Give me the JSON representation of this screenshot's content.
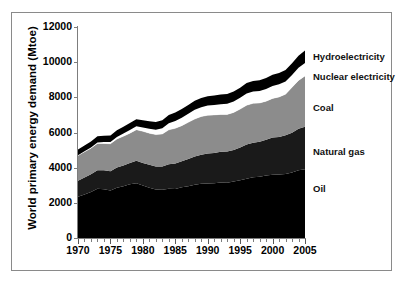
{
  "chart_data": {
    "type": "area",
    "stacked": true,
    "title": "",
    "xlabel": "",
    "ylabel": "World primary energy demand (Mtoe)",
    "xlim": [
      1970,
      2005
    ],
    "ylim": [
      0,
      12000
    ],
    "grid": false,
    "legend_position": "right-inline",
    "y_ticks": [
      0,
      2000,
      4000,
      6000,
      8000,
      10000,
      12000
    ],
    "y_tick_labels": [
      "0",
      "2000",
      "4000",
      "6000",
      "8000",
      "10000",
      "12000"
    ],
    "x_ticks": [
      1970,
      1975,
      1980,
      1985,
      1990,
      1995,
      2000,
      2005
    ],
    "x_tick_labels": [
      "1970",
      "1975",
      "1980",
      "1985",
      "1990",
      "1995",
      "2000",
      "2005"
    ],
    "x": [
      1970,
      1971,
      1972,
      1973,
      1974,
      1975,
      1976,
      1977,
      1978,
      1979,
      1980,
      1981,
      1982,
      1983,
      1984,
      1985,
      1986,
      1987,
      1988,
      1989,
      1990,
      1991,
      1992,
      1993,
      1994,
      1995,
      1996,
      1997,
      1998,
      1999,
      2000,
      2001,
      2002,
      2003,
      2004,
      2005
    ],
    "series": [
      {
        "name": "Oil",
        "color": "#000000",
        "values": [
          2350,
          2480,
          2620,
          2800,
          2770,
          2700,
          2860,
          2950,
          3050,
          3120,
          2980,
          2860,
          2760,
          2740,
          2800,
          2790,
          2890,
          2950,
          3030,
          3080,
          3100,
          3110,
          3150,
          3140,
          3210,
          3280,
          3370,
          3460,
          3480,
          3550,
          3600,
          3610,
          3640,
          3720,
          3860,
          3910
        ]
      },
      {
        "name": "Natural gas",
        "color": "#1a1a1a",
        "values": [
          900,
          960,
          1010,
          1060,
          1080,
          1090,
          1150,
          1180,
          1220,
          1280,
          1290,
          1300,
          1300,
          1320,
          1400,
          1440,
          1470,
          1540,
          1600,
          1660,
          1700,
          1730,
          1750,
          1780,
          1800,
          1870,
          1950,
          1960,
          1990,
          2040,
          2110,
          2140,
          2200,
          2270,
          2350,
          2420
        ]
      },
      {
        "name": "Coal",
        "color": "#8c8c8c",
        "values": [
          1440,
          1460,
          1480,
          1520,
          1530,
          1570,
          1620,
          1660,
          1690,
          1760,
          1800,
          1800,
          1820,
          1860,
          1950,
          2010,
          2030,
          2090,
          2140,
          2170,
          2180,
          2160,
          2130,
          2110,
          2130,
          2180,
          2230,
          2240,
          2210,
          2190,
          2230,
          2270,
          2340,
          2580,
          2750,
          2890
        ]
      },
      {
        "name": "Nuclear electricity",
        "color": "#ffffff",
        "values": [
          20,
          30,
          40,
          55,
          75,
          100,
          120,
          150,
          180,
          190,
          210,
          250,
          280,
          320,
          380,
          420,
          450,
          480,
          520,
          530,
          550,
          570,
          580,
          600,
          620,
          640,
          670,
          670,
          680,
          700,
          710,
          720,
          720,
          700,
          720,
          730
        ]
      },
      {
        "name": "Hydroelectricity",
        "color": "#000000",
        "values": [
          320,
          330,
          340,
          350,
          360,
          370,
          380,
          390,
          400,
          410,
          420,
          430,
          440,
          450,
          470,
          480,
          490,
          500,
          510,
          520,
          530,
          540,
          550,
          560,
          570,
          580,
          590,
          600,
          610,
          620,
          630,
          640,
          650,
          670,
          690,
          710
        ]
      }
    ]
  },
  "axis": {
    "y_title": "World primary energy demand (Mtoe)"
  },
  "series_labels": [
    {
      "label": "Hydroelectricity",
      "top": 51
    },
    {
      "label": "Nuclear electricity",
      "top": 71
    },
    {
      "label": "Coal",
      "top": 102
    },
    {
      "label": "Natural gas",
      "top": 146
    },
    {
      "label": "Oil",
      "top": 183
    }
  ]
}
